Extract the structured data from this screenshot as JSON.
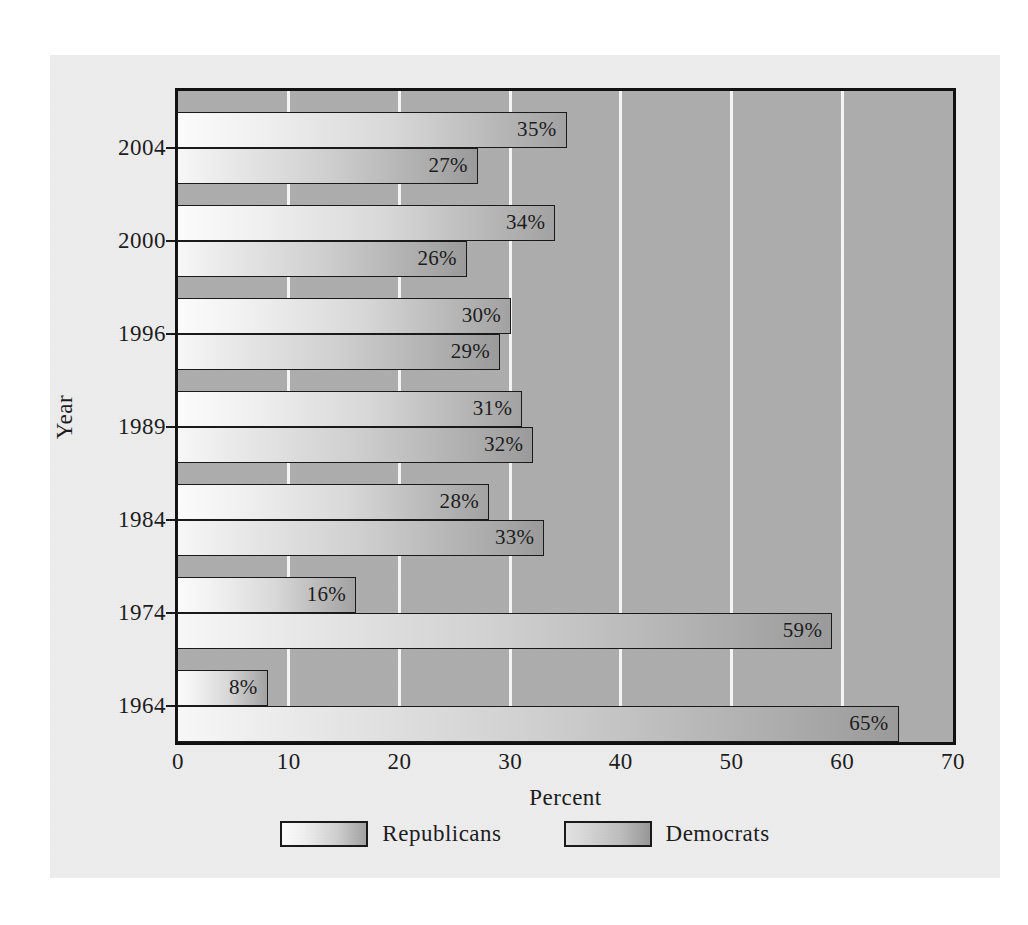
{
  "chart_data": {
    "type": "bar",
    "orientation": "horizontal",
    "title": "",
    "xlabel": "Percent",
    "ylabel": "Year",
    "xlim": [
      0,
      70
    ],
    "xticks": [
      0,
      10,
      20,
      30,
      40,
      50,
      60,
      70
    ],
    "categories": [
      "2004",
      "2000",
      "1996",
      "1989",
      "1984",
      "1974",
      "1964"
    ],
    "grid": "vertical-white-gridlines",
    "legend_position": "bottom-center",
    "series": [
      {
        "name": "Republicans",
        "values": [
          35,
          34,
          30,
          31,
          28,
          16,
          8
        ],
        "labels": [
          "35%",
          "27%",
          "30%",
          "31%",
          "28%",
          "16%",
          "8%"
        ]
      },
      {
        "name": "Democrats",
        "values": [
          27,
          26,
          29,
          32,
          33,
          59,
          65
        ],
        "labels": [
          "27%",
          "26%",
          "29%",
          "32%",
          "33%",
          "59%",
          "65%"
        ]
      }
    ],
    "groups": [
      {
        "year": "2004",
        "republicans": 35,
        "republicans_label": "35%",
        "democrats": 27,
        "democrats_label": "27%"
      },
      {
        "year": "2000",
        "republicans": 34,
        "republicans_label": "34%",
        "democrats": 26,
        "democrats_label": "26%"
      },
      {
        "year": "1996",
        "republicans": 30,
        "republicans_label": "30%",
        "democrats": 29,
        "democrats_label": "29%"
      },
      {
        "year": "1989",
        "republicans": 31,
        "republicans_label": "31%",
        "democrats": 32,
        "democrats_label": "32%"
      },
      {
        "year": "1984",
        "republicans": 28,
        "republicans_label": "28%",
        "democrats": 33,
        "democrats_label": "33%"
      },
      {
        "year": "1974",
        "republicans": 16,
        "republicans_label": "16%",
        "democrats": 59,
        "democrats_label": "59%"
      },
      {
        "year": "1964",
        "republicans": 8,
        "republicans_label": "8%",
        "democrats": 65,
        "democrats_label": "65%"
      }
    ],
    "colors": {
      "plot_background": "#adadad",
      "gridline": "#f4f4f4",
      "panel_background": "#ececed",
      "axis": "#111111",
      "bar_border": "#1a1a1a",
      "text": "#1d1d1d"
    }
  },
  "axes": {
    "x_title": "Percent",
    "y_title": "Year",
    "x_tick_labels": [
      "0",
      "10",
      "20",
      "30",
      "40",
      "50",
      "60",
      "70"
    ],
    "y_tick_labels": [
      "2004",
      "2000",
      "1996",
      "1989",
      "1984",
      "1974",
      "1964"
    ]
  },
  "legend": {
    "items": [
      {
        "label": "Republicans"
      },
      {
        "label": "Democrats"
      }
    ]
  }
}
